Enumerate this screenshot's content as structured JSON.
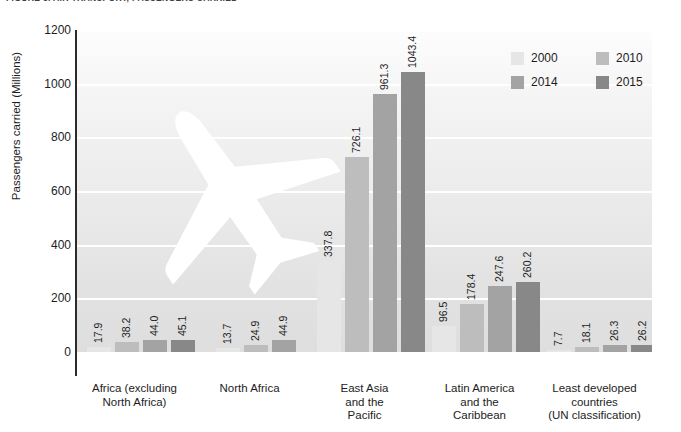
{
  "figure": {
    "title": "FIGURE 3. AIR TRANSPORT, PASSENGERS CARRIED"
  },
  "legend": {
    "position": "top-right",
    "items": [
      {
        "label": "2000",
        "color": "#e6e6e6"
      },
      {
        "label": "2010",
        "color": "#bdbdbd"
      },
      {
        "label": "2014",
        "color": "#a3a3a3"
      },
      {
        "label": "2015",
        "color": "#888888"
      }
    ]
  },
  "axes": {
    "ylabel": "Passengers carried (Millions)",
    "yticks": [
      "0",
      "200",
      "400",
      "600",
      "800",
      "1000",
      "1200"
    ],
    "xlabel": ""
  },
  "chart_data": {
    "type": "bar",
    "title": "FIGURE 3. AIR TRANSPORT, PASSENGERS CARRIED",
    "xlabel": "",
    "ylabel": "Passengers carried (Millions)",
    "ylim": [
      0,
      1200
    ],
    "ytick_step": 200,
    "grid": true,
    "legend_position": "top-right",
    "categories": [
      "Africa (excluding North Africa)",
      "North Africa",
      "East Asia and the Pacific",
      "Latin America and the Caribbean",
      "Least developed countries (UN classification)"
    ],
    "category_lines": [
      [
        "Africa (excluding",
        "North Africa)"
      ],
      [
        "North Africa"
      ],
      [
        "East Asia",
        "and the",
        "Pacific"
      ],
      [
        "Latin America",
        "and the",
        "Caribbean"
      ],
      [
        "Least developed",
        "countries",
        "(UN classification)"
      ]
    ],
    "series": [
      {
        "name": "2000",
        "color": "#e6e6e6",
        "values": [
          17.9,
          13.7,
          337.8,
          96.5,
          7.7
        ]
      },
      {
        "name": "2010",
        "color": "#bdbdbd",
        "values": [
          38.2,
          24.9,
          726.1,
          178.4,
          18.1
        ]
      },
      {
        "name": "2014",
        "color": "#a3a3a3",
        "values": [
          44.0,
          44.9,
          961.3,
          247.6,
          26.3
        ]
      },
      {
        "name": "2015",
        "color": "#888888",
        "values": [
          45.1,
          null,
          1043.4,
          260.2,
          26.2
        ]
      }
    ],
    "value_labels": [
      [
        "17.9",
        "38.2",
        "44.0",
        "45.1"
      ],
      [
        "13.7",
        "24.9",
        "44.9"
      ],
      [
        "337.8",
        "726.1",
        "961.3",
        "1043.4"
      ],
      [
        "96.5",
        "178.4",
        "247.6",
        "260.2"
      ],
      [
        "7.7",
        "18.1",
        "26.3",
        "26.2"
      ]
    ]
  },
  "watermark": {
    "name": "airplane-watermark",
    "color": "#ffffff"
  }
}
